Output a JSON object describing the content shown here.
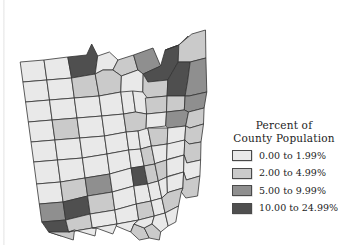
{
  "figure": {
    "kind": "choropleth-map",
    "region": "Ohio counties",
    "background_color": "#ffffff",
    "outline_color": "#333333"
  },
  "legend": {
    "title_line1": "Percent of",
    "title_line2": "County Population",
    "classes": [
      {
        "label": "0.00 to 1.99%",
        "color": "#e9e9e9",
        "min": 0.0,
        "max": 1.99
      },
      {
        "label": "2.00 to 4.99%",
        "color": "#cacaca",
        "min": 2.0,
        "max": 4.99
      },
      {
        "label": "5.00 to 9.99%",
        "color": "#8f8f8f",
        "min": 5.0,
        "max": 9.99
      },
      {
        "label": "10.00 to 24.99%",
        "color": "#4f4f4f",
        "min": 10.0,
        "max": 24.99
      }
    ]
  },
  "chart_data": {
    "type": "heatmap",
    "title": "Percent of County Population",
    "xlabel": "",
    "ylabel": "",
    "legend_position": "right",
    "grid": false,
    "class_breaks": [
      0.0,
      2.0,
      5.0,
      10.0,
      25.0
    ],
    "class_colors": [
      "#e9e9e9",
      "#cacaca",
      "#8f8f8f",
      "#4f4f4f"
    ],
    "class_labels": [
      "0.00 to 1.99%",
      "2.00 to 4.99%",
      "5.00 to 9.99%",
      "10.00 to 24.99%"
    ],
    "regions": [
      {
        "name": "Williams",
        "class": 1
      },
      {
        "name": "Fulton",
        "class": 1
      },
      {
        "name": "Lucas",
        "class": 4
      },
      {
        "name": "Ottawa",
        "class": 1
      },
      {
        "name": "Sandusky",
        "class": 2
      },
      {
        "name": "Erie",
        "class": 2
      },
      {
        "name": "Lorain",
        "class": 3
      },
      {
        "name": "Cuyahoga",
        "class": 4
      },
      {
        "name": "Lake",
        "class": 2
      },
      {
        "name": "Ashtabula",
        "class": 2
      },
      {
        "name": "Defiance",
        "class": 1
      },
      {
        "name": "Henry",
        "class": 1
      },
      {
        "name": "Wood",
        "class": 2
      },
      {
        "name": "Seneca",
        "class": 1
      },
      {
        "name": "Huron",
        "class": 1
      },
      {
        "name": "Medina",
        "class": 2
      },
      {
        "name": "Summit",
        "class": 4
      },
      {
        "name": "Portage",
        "class": 2
      },
      {
        "name": "Trumbull",
        "class": 3
      },
      {
        "name": "Paulding",
        "class": 1
      },
      {
        "name": "Putnam",
        "class": 1
      },
      {
        "name": "Hancock",
        "class": 1
      },
      {
        "name": "Wyandot",
        "class": 1
      },
      {
        "name": "Crawford",
        "class": 1
      },
      {
        "name": "Richland",
        "class": 2
      },
      {
        "name": "Ashland",
        "class": 1
      },
      {
        "name": "Wayne",
        "class": 2
      },
      {
        "name": "Stark",
        "class": 3
      },
      {
        "name": "Mahoning",
        "class": 3
      },
      {
        "name": "Van Wert",
        "class": 1
      },
      {
        "name": "Allen",
        "class": 2
      },
      {
        "name": "Hardin",
        "class": 1
      },
      {
        "name": "Marion",
        "class": 1
      },
      {
        "name": "Morrow",
        "class": 1
      },
      {
        "name": "Knox",
        "class": 1
      },
      {
        "name": "Holmes",
        "class": 1
      },
      {
        "name": "Tuscarawas",
        "class": 2
      },
      {
        "name": "Columbiana",
        "class": 2
      },
      {
        "name": "Mercer",
        "class": 1
      },
      {
        "name": "Auglaize",
        "class": 1
      },
      {
        "name": "Logan",
        "class": 1
      },
      {
        "name": "Union",
        "class": 1
      },
      {
        "name": "Delaware",
        "class": 1
      },
      {
        "name": "Licking",
        "class": 2
      },
      {
        "name": "Coshocton",
        "class": 1
      },
      {
        "name": "Carroll",
        "class": 1
      },
      {
        "name": "Jefferson",
        "class": 2
      },
      {
        "name": "Darke",
        "class": 1
      },
      {
        "name": "Shelby",
        "class": 1
      },
      {
        "name": "Champaign",
        "class": 1
      },
      {
        "name": "Madison",
        "class": 1
      },
      {
        "name": "Franklin",
        "class": 4
      },
      {
        "name": "Muskingum",
        "class": 2
      },
      {
        "name": "Guernsey",
        "class": 1
      },
      {
        "name": "Harrison",
        "class": 1
      },
      {
        "name": "Belmont",
        "class": 2
      },
      {
        "name": "Miami",
        "class": 2
      },
      {
        "name": "Clark",
        "class": 3
      },
      {
        "name": "Greene",
        "class": 2
      },
      {
        "name": "Fayette",
        "class": 1
      },
      {
        "name": "Pickaway",
        "class": 1
      },
      {
        "name": "Fairfield",
        "class": 2
      },
      {
        "name": "Perry",
        "class": 1
      },
      {
        "name": "Morgan",
        "class": 1
      },
      {
        "name": "Noble",
        "class": 1
      },
      {
        "name": "Monroe",
        "class": 1
      },
      {
        "name": "Preble",
        "class": 1
      },
      {
        "name": "Montgomery",
        "class": 4
      },
      {
        "name": "Butler",
        "class": 3
      },
      {
        "name": "Warren",
        "class": 2
      },
      {
        "name": "Clinton",
        "class": 1
      },
      {
        "name": "Ross",
        "class": 2
      },
      {
        "name": "Hocking",
        "class": 1
      },
      {
        "name": "Athens",
        "class": 2
      },
      {
        "name": "Washington",
        "class": 2
      },
      {
        "name": "Hamilton",
        "class": 4
      },
      {
        "name": "Clermont",
        "class": 2
      },
      {
        "name": "Brown",
        "class": 1
      },
      {
        "name": "Highland",
        "class": 1
      },
      {
        "name": "Pike",
        "class": 1
      },
      {
        "name": "Vinton",
        "class": 1
      },
      {
        "name": "Meigs",
        "class": 1
      },
      {
        "name": "Adams",
        "class": 1
      },
      {
        "name": "Scioto",
        "class": 2
      },
      {
        "name": "Jackson",
        "class": 1
      },
      {
        "name": "Gallia",
        "class": 1
      },
      {
        "name": "Lawrence",
        "class": 2
      },
      {
        "name": "Wyandot2",
        "class": 1
      }
    ]
  }
}
